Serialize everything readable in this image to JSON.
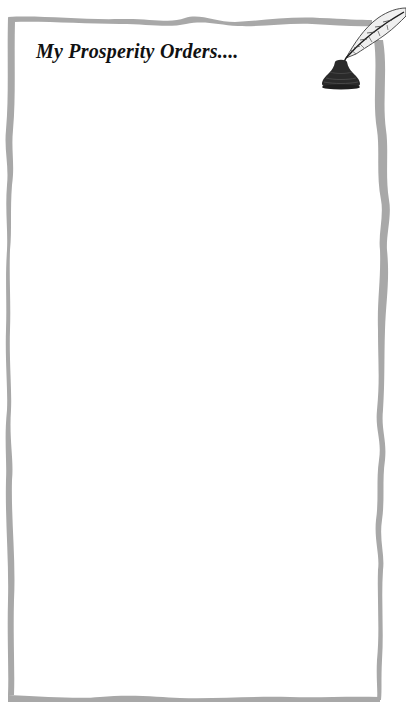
{
  "page": {
    "title": "My Prosperity Orders....",
    "writing_area": {
      "content": ""
    }
  },
  "decorations": {
    "border": "hand-drawn-ribbon-frame",
    "illustration": "quill-and-inkwell-icon"
  },
  "colors": {
    "background": "#ffffff",
    "border": "#a6a6a6",
    "title_text": "#111111",
    "ink": "#2a2a2a"
  }
}
